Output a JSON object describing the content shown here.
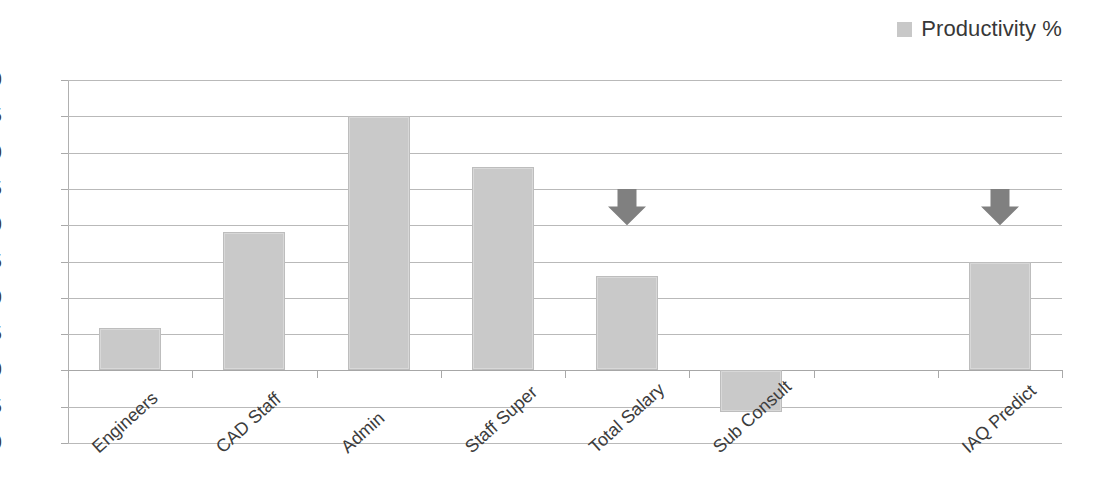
{
  "legend": {
    "entries": [
      {
        "label": "Productivity %",
        "color": "#c8c8c8",
        "swatch_name": "legend-swatch-productivity"
      }
    ],
    "position": "top-right"
  },
  "chart_data": {
    "type": "bar",
    "title": "",
    "xlabel": "",
    "ylabel": "",
    "categories": [
      "Engineers",
      "CAD Staff",
      "Admin",
      "Staff Super",
      "Total Salary",
      "Sub Consult",
      "IAQ Predict"
    ],
    "series": [
      {
        "name": "Productivity %",
        "color": "#c9c9c9",
        "values": [
          5.8,
          19,
          35,
          28,
          13,
          -5.8,
          15
        ]
      }
    ],
    "ylim": [
      -10,
      40
    ],
    "yticks": [
      40,
      35,
      30,
      25,
      20,
      15,
      10,
      5,
      0,
      -5,
      -10
    ],
    "ytick_labels": [
      "40",
      "35",
      "30",
      "25",
      "20",
      "15",
      "10",
      "5",
      "0",
      "-5",
      "-10"
    ],
    "grid": true,
    "grid_axis": "y",
    "legend_position": "top-right",
    "slots": 8,
    "category_slot_index": [
      0,
      1,
      2,
      3,
      4,
      5,
      7
    ],
    "annotations": [
      {
        "kind": "down-arrow",
        "name": "down-arrow-total-salary",
        "target_category": "Total Salary",
        "slot_index": 4,
        "y_top": 25,
        "y_bottom": 20,
        "color": "#808080"
      },
      {
        "kind": "down-arrow",
        "name": "down-arrow-iaq-predict",
        "target_category": "IAQ Predict",
        "slot_index": 7,
        "y_top": 25,
        "y_bottom": 20,
        "color": "#808080"
      }
    ]
  },
  "colors": {
    "bar_fill": "#c9c9c9",
    "bar_border": "#bdbdbd",
    "gridline": "#b9b9b9",
    "axis": "#b0b0b0",
    "arrow": "#808080",
    "text": "#3c3c3c",
    "background": "#ffffff"
  }
}
